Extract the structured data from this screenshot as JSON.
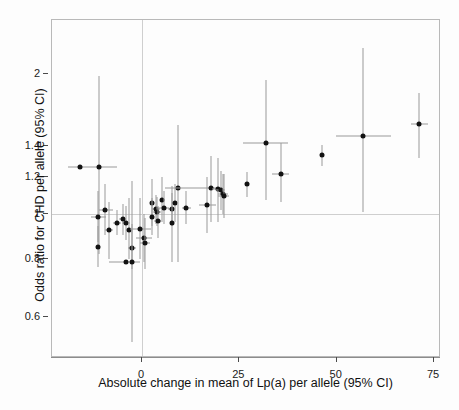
{
  "chart_data": {
    "type": "scatter",
    "title": "",
    "xlabel": "Absolute change in mean of Lp(a) per allele (95% CI)",
    "ylabel": "Odds ratio for CHD per allele (95% CI)",
    "xlim": [
      -19,
      75
    ],
    "ylim": [
      0.52,
      2.3
    ],
    "yscale": "log",
    "xticks": [
      0,
      25,
      50,
      75
    ],
    "xticklabels": [
      "0",
      "25",
      "50",
      "75"
    ],
    "yticks": [
      0.6,
      0.8,
      1,
      1.2,
      1.4,
      2
    ],
    "yticklabels": [
      "0.6",
      "0.8",
      "1",
      "1.2",
      "1.4",
      "2"
    ],
    "grid": false,
    "reference_lines": {
      "horizontal_y": 1.0,
      "vertical_x": 0
    },
    "legend": null,
    "marker": "filled-circle",
    "error_bar_color": "#9a9a9a",
    "marker_color": "#121212",
    "points": [
      {
        "x": -16.0,
        "y": 1.26,
        "xlow": -19.0,
        "xhigh": -6.5,
        "ylow": 1.26,
        "yhigh": 1.26
      },
      {
        "x": -11.0,
        "y": 1.26,
        "xlow": -11.0,
        "xhigh": -11.0,
        "ylow": 0.82,
        "yhigh": 1.98
      },
      {
        "x": -11.2,
        "y": 0.985,
        "xlow": -13.2,
        "xhigh": -9.2,
        "ylow": 0.87,
        "yhigh": 1.12
      },
      {
        "x": -11.2,
        "y": 0.85,
        "xlow": -11.2,
        "xhigh": -11.2,
        "ylow": 0.77,
        "yhigh": 0.94
      },
      {
        "x": -9.5,
        "y": 1.02,
        "xlow": -11.0,
        "xhigh": -7.5,
        "ylow": 0.9,
        "yhigh": 1.16
      },
      {
        "x": -8.5,
        "y": 0.925,
        "xlow": -9.5,
        "xhigh": -7.5,
        "ylow": 0.8,
        "yhigh": 1.06
      },
      {
        "x": -6.5,
        "y": 0.955,
        "xlow": -7.5,
        "xhigh": -5.5,
        "ylow": 0.9,
        "yhigh": 1.02
      },
      {
        "x": -5.0,
        "y": 0.975,
        "xlow": -5.9,
        "xhigh": -4.1,
        "ylow": 0.9,
        "yhigh": 1.05
      },
      {
        "x": -4.2,
        "y": 0.955,
        "xlow": -5.2,
        "xhigh": -3.2,
        "ylow": 0.88,
        "yhigh": 1.04
      },
      {
        "x": -4.0,
        "y": 0.79,
        "xlow": -8.5,
        "xhigh": -0.5,
        "ylow": 0.79,
        "yhigh": 0.79
      },
      {
        "x": -3.4,
        "y": 0.925,
        "xlow": -3.4,
        "xhigh": -3.4,
        "ylow": 0.8,
        "yhigh": 1.08
      },
      {
        "x": -2.6,
        "y": 0.845,
        "xlow": -3.6,
        "xhigh": -1.6,
        "ylow": 0.76,
        "yhigh": 0.95
      },
      {
        "x": -2.6,
        "y": 0.79,
        "xlow": -2.6,
        "xhigh": -2.6,
        "ylow": 0.53,
        "yhigh": 1.18
      },
      {
        "x": -0.4,
        "y": 0.93,
        "xlow": -3.0,
        "xhigh": 2.2,
        "ylow": 0.8,
        "yhigh": 1.08
      },
      {
        "x": 0.5,
        "y": 0.89,
        "xlow": -1.5,
        "xhigh": 2.5,
        "ylow": 0.79,
        "yhigh": 1.0
      },
      {
        "x": 0.8,
        "y": 0.865,
        "xlow": -0.4,
        "xhigh": 2.0,
        "ylow": 0.76,
        "yhigh": 0.98
      },
      {
        "x": 2.5,
        "y": 1.055,
        "xlow": 2.5,
        "xhigh": 2.5,
        "ylow": 0.94,
        "yhigh": 1.19
      },
      {
        "x": 2.6,
        "y": 0.985,
        "xlow": 2.6,
        "xhigh": 2.6,
        "ylow": 0.9,
        "yhigh": 1.08
      },
      {
        "x": 3.6,
        "y": 1.025,
        "xlow": 2.6,
        "xhigh": 4.6,
        "ylow": 0.95,
        "yhigh": 1.1
      },
      {
        "x": 3.8,
        "y": 1.01,
        "xlow": 2.8,
        "xhigh": 4.8,
        "ylow": 0.94,
        "yhigh": 1.09
      },
      {
        "x": 4.0,
        "y": 0.965,
        "xlow": 3.0,
        "xhigh": 5.0,
        "ylow": 0.89,
        "yhigh": 1.04
      },
      {
        "x": 5.2,
        "y": 1.07,
        "xlow": 5.2,
        "xhigh": 5.2,
        "ylow": 0.96,
        "yhigh": 1.2
      },
      {
        "x": 5.6,
        "y": 1.03,
        "xlow": 4.2,
        "xhigh": 7.0,
        "ylow": 0.95,
        "yhigh": 1.12
      },
      {
        "x": 7.6,
        "y": 1.025,
        "xlow": 6.6,
        "xhigh": 8.6,
        "ylow": 0.94,
        "yhigh": 1.11
      },
      {
        "x": 7.8,
        "y": 0.955,
        "xlow": 7.8,
        "xhigh": 7.8,
        "ylow": 0.79,
        "yhigh": 1.15
      },
      {
        "x": 8.4,
        "y": 1.055,
        "xlow": 8.4,
        "xhigh": 8.4,
        "ylow": 0.96,
        "yhigh": 1.16
      },
      {
        "x": 9.2,
        "y": 1.14,
        "xlow": 9.2,
        "xhigh": 9.2,
        "ylow": 0.79,
        "yhigh": 1.55
      },
      {
        "x": 11.4,
        "y": 1.03,
        "xlow": 10.2,
        "xhigh": 12.6,
        "ylow": 0.95,
        "yhigh": 1.12
      },
      {
        "x": 16.8,
        "y": 1.045,
        "xlow": 14.6,
        "xhigh": 19.0,
        "ylow": 0.91,
        "yhigh": 1.2
      },
      {
        "x": 17.6,
        "y": 1.14,
        "xlow": 6.0,
        "xhigh": 19.2,
        "ylow": 0.96,
        "yhigh": 1.33
      },
      {
        "x": 19.4,
        "y": 1.13,
        "xlow": 18.0,
        "xhigh": 20.8,
        "ylow": 0.96,
        "yhigh": 1.32
      },
      {
        "x": 20.2,
        "y": 1.125,
        "xlow": 19.0,
        "xhigh": 21.4,
        "ylow": 1.02,
        "yhigh": 1.24
      },
      {
        "x": 20.8,
        "y": 1.105,
        "xlow": 19.4,
        "xhigh": 22.2,
        "ylow": 1.0,
        "yhigh": 1.22
      },
      {
        "x": 21.0,
        "y": 1.095,
        "xlow": 19.6,
        "xhigh": 22.4,
        "ylow": 0.98,
        "yhigh": 1.22
      },
      {
        "x": 27.0,
        "y": 1.16,
        "xlow": 27.0,
        "xhigh": 27.0,
        "ylow": 1.09,
        "yhigh": 1.23
      },
      {
        "x": 31.8,
        "y": 1.42,
        "xlow": 26.0,
        "xhigh": 37.6,
        "ylow": 1.07,
        "yhigh": 1.94
      },
      {
        "x": 35.6,
        "y": 1.22,
        "xlow": 33.4,
        "xhigh": 37.8,
        "ylow": 1.06,
        "yhigh": 1.42
      },
      {
        "x": 46.2,
        "y": 1.34,
        "xlow": 46.2,
        "xhigh": 46.2,
        "ylow": 1.27,
        "yhigh": 1.41
      },
      {
        "x": 56.8,
        "y": 1.47,
        "xlow": 49.8,
        "xhigh": 64.0,
        "ylow": 1.01,
        "yhigh": 2.27
      },
      {
        "x": 71.2,
        "y": 1.56,
        "xlow": 69.0,
        "xhigh": 73.4,
        "ylow": 1.32,
        "yhigh": 1.82
      }
    ]
  },
  "axes": {
    "y_title": "Odds ratio for CHD per allele (95% CI)",
    "x_title": "Absolute change in mean of Lp(a) per allele (95% CI)"
  },
  "colors": {
    "marker": "#121212",
    "error_bar": "#9a9a9a",
    "frame": "#b9b9b9",
    "reference": "#cfcfcf",
    "text": "#111111",
    "background": "#fdfdfd"
  }
}
